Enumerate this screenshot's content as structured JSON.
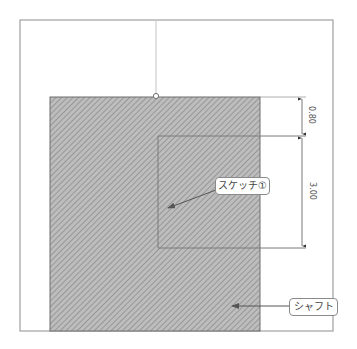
{
  "caption": {
    "top_partial_text": ""
  },
  "drawing": {
    "colors": {
      "frame": "#a0a0a0",
      "hatch_fill": "#bdbdbd",
      "hatch_line": "#8e8e8e",
      "outline": "#6f6f6f",
      "sketch_line": "#7a7a7a",
      "dimension": "#555555"
    },
    "dimensions": [
      {
        "label": "0.80"
      },
      {
        "label": "3.00"
      }
    ],
    "callouts": [
      {
        "label": "スケッチ①"
      },
      {
        "label": "シャフト"
      }
    ]
  }
}
